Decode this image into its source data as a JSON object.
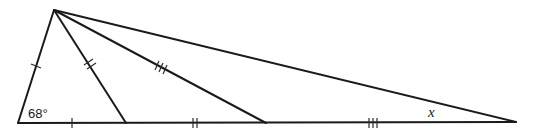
{
  "diagram": {
    "type": "geometry-triangle",
    "vertices": {
      "apex": [
        54,
        10
      ],
      "base_left": [
        18,
        123
      ],
      "foot_1": [
        126,
        123
      ],
      "foot_2": [
        266,
        123
      ],
      "base_right": [
        516,
        122
      ]
    },
    "labels": {
      "angle_base_left": "68°",
      "unknown_angle": "x"
    },
    "tick_groups": [
      {
        "name": "single",
        "count": 1,
        "segments": [
          "apex-base_left",
          "base_left-foot_1"
        ]
      },
      {
        "name": "double",
        "count": 2,
        "segments": [
          "apex-foot_1",
          "foot_1-foot_2"
        ]
      },
      {
        "name": "triple",
        "count": 3,
        "segments": [
          "apex-foot_2",
          "foot_2-base_right"
        ]
      }
    ]
  }
}
